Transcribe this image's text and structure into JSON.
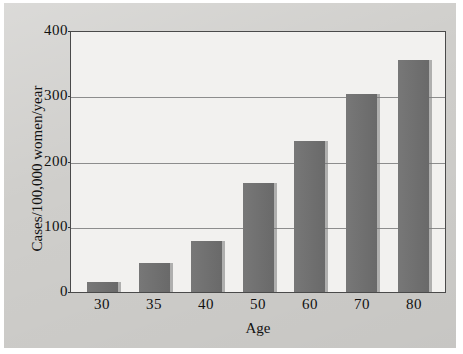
{
  "chart_data": {
    "type": "bar",
    "title": "",
    "subtitle": "",
    "xlabel": "Age",
    "ylabel": "Cases/100,000 women/year",
    "categories": [
      "30",
      "35",
      "40",
      "50",
      "60",
      "70",
      "80"
    ],
    "values": [
      15,
      45,
      78,
      167,
      233,
      305,
      357
    ],
    "series": [
      {
        "name": "Incidence",
        "values": [
          15,
          45,
          78,
          167,
          233,
          305,
          357
        ]
      }
    ],
    "ylim": [
      0,
      400
    ],
    "yticks": [
      "0",
      "100",
      "200",
      "300",
      "400"
    ],
    "ytick_values": [
      0,
      100,
      200,
      300,
      400
    ],
    "grid": true,
    "legend": "none",
    "bar_color": "#6f6f6f",
    "plot_background": "#f2f1ef",
    "figure_background": "#cfcecb",
    "axis_color": "#4a4a4a",
    "gridline_color": "#8d8d8d"
  }
}
